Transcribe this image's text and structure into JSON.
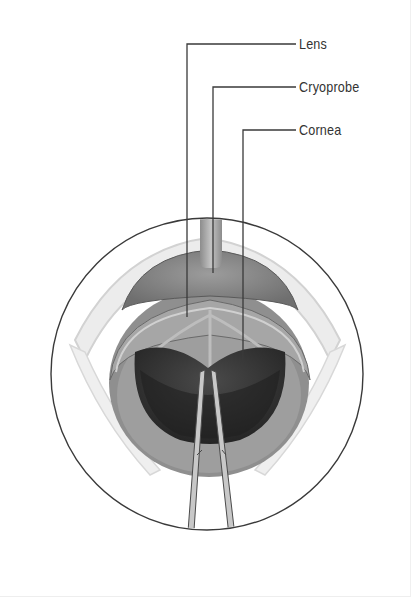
{
  "diagram": {
    "labels": [
      {
        "id": "lens",
        "text": "Lens",
        "text_x": 299,
        "text_y": 36,
        "leader": {
          "corner_x": 187,
          "corner_y": 44,
          "end_x": 296,
          "target_y": 317
        }
      },
      {
        "id": "cryoprobe",
        "text": "Cryoprobe",
        "text_x": 299,
        "text_y": 79,
        "leader": {
          "corner_x": 213,
          "corner_y": 87,
          "end_x": 296,
          "target_y": 273
        }
      },
      {
        "id": "cornea",
        "text": "Cornea",
        "text_x": 299,
        "text_y": 122,
        "leader": {
          "corner_x": 243,
          "corner_y": 130,
          "end_x": 296,
          "target_y": 362
        }
      }
    ],
    "view_circle": {
      "cx": 207,
      "cy": 374,
      "r": 156
    },
    "colors": {
      "outline": "#3a3a3a",
      "leader_line": "#3a3a3a",
      "label_text": "#333333",
      "lens": "#8a8a8a",
      "iris_ring": "#9a9a9a",
      "pupil": "#2e2e2e",
      "probe": "#a8a8a8",
      "forceps": "#bdbdbd",
      "lid": "#e6e6e6"
    }
  }
}
